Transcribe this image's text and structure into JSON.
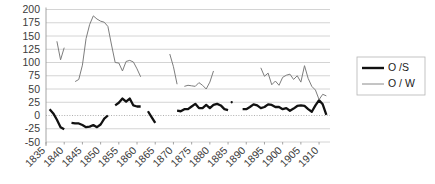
{
  "chart_data": {
    "type": "line",
    "title": "",
    "xlabel": "",
    "ylabel": "",
    "ylim": [
      -50,
      200
    ],
    "xlim": [
      1835,
      1913
    ],
    "grid": true,
    "legend_position": "right",
    "ytick_labels": [
      "200",
      "175",
      "150",
      "125",
      "100",
      "75",
      "50",
      "25",
      "0",
      "-25",
      "-50"
    ],
    "ytick_values": [
      200,
      175,
      150,
      125,
      100,
      75,
      50,
      25,
      0,
      -25,
      -50
    ],
    "xtick_labels": [
      "1835",
      "1840",
      "1845",
      "1850",
      "1855",
      "1860",
      "1865",
      "1870",
      "1875",
      "1880",
      "1885",
      "1890",
      "1895",
      "1900",
      "1905",
      "1910"
    ],
    "xtick_values": [
      1835,
      1840,
      1845,
      1850,
      1855,
      1860,
      1865,
      1870,
      1875,
      1880,
      1885,
      1890,
      1895,
      1900,
      1905,
      1910
    ],
    "series": [
      {
        "name": "O /S",
        "color": "#111111",
        "width": 2.3,
        "segments": [
          {
            "x": [
              1836,
              1837,
              1838,
              1839,
              1840
            ],
            "y": [
              12,
              4,
              -8,
              -22,
              -26
            ]
          },
          {
            "x": [
              1842,
              1843,
              1844,
              1845,
              1846,
              1847,
              1848,
              1849,
              1850,
              1851,
              1852
            ],
            "y": [
              -14,
              -15,
              -15,
              -18,
              -22,
              -21,
              -18,
              -22,
              -17,
              -6,
              0
            ]
          },
          {
            "x": [
              1854,
              1855,
              1856,
              1857,
              1858,
              1859,
              1860,
              1861
            ],
            "y": [
              19,
              24,
              32,
              26,
              32,
              19,
              17,
              17
            ]
          },
          {
            "x": [
              1863,
              1864,
              1865
            ],
            "y": [
              8,
              -3,
              -14
            ]
          },
          {
            "x": [
              1871,
              1872,
              1873,
              1874,
              1875,
              1876,
              1877,
              1878,
              1879,
              1880,
              1881,
              1882,
              1883,
              1884,
              1885
            ],
            "y": [
              9,
              8,
              12,
              12,
              17,
              22,
              14,
              14,
              20,
              14,
              20,
              22,
              19,
              12,
              10
            ]
          },
          {
            "x": [
              1886
            ],
            "y": [
              25
            ]
          },
          {
            "x": [
              1889,
              1890,
              1891,
              1892,
              1893,
              1894,
              1895,
              1896,
              1897,
              1898,
              1899,
              1900,
              1901,
              1902,
              1903,
              1904,
              1905,
              1906,
              1907,
              1908,
              1909,
              1910,
              1911,
              1912
            ],
            "y": [
              12,
              12,
              16,
              21,
              19,
              14,
              16,
              21,
              20,
              16,
              16,
              12,
              14,
              9,
              13,
              18,
              19,
              18,
              12,
              7,
              19,
              29,
              21,
              1
            ]
          }
        ]
      },
      {
        "name": "O / W",
        "color": "#7d7d7d",
        "width": 1.0,
        "segments": [
          {
            "x": [
              1838,
              1839,
              1840
            ],
            "y": [
              140,
              105,
              128
            ]
          },
          {
            "x": [
              1843,
              1844,
              1845,
              1846,
              1847,
              1848,
              1849,
              1850,
              1851,
              1852,
              1853,
              1854,
              1855,
              1856,
              1857,
              1858,
              1859,
              1860,
              1861
            ],
            "y": [
              64,
              68,
              95,
              145,
              172,
              188,
              182,
              178,
              176,
              168,
              133,
              100,
              99,
              84,
              102,
              104,
              101,
              88,
              73
            ]
          },
          {
            "x": [
              1869,
              1870,
              1871
            ],
            "y": [
              116,
              92,
              59
            ]
          },
          {
            "x": [
              1873,
              1874,
              1875,
              1876,
              1877,
              1878,
              1879,
              1880,
              1881
            ],
            "y": [
              55,
              57,
              56,
              55,
              62,
              57,
              50,
              63,
              84
            ]
          },
          {
            "x": [
              1894,
              1895,
              1896,
              1897,
              1898,
              1899,
              1900,
              1901,
              1902,
              1903,
              1904,
              1905,
              1906,
              1907,
              1908,
              1909,
              1910,
              1911,
              1912
            ],
            "y": [
              90,
              74,
              80,
              58,
              65,
              57,
              72,
              76,
              78,
              68,
              75,
              63,
              94,
              70,
              55,
              48,
              30,
              40,
              37
            ]
          }
        ]
      }
    ]
  },
  "legend": {
    "items": [
      {
        "label": "O /S",
        "color": "#111111"
      },
      {
        "label": "O / W",
        "color": "#7d7d7d"
      }
    ]
  }
}
